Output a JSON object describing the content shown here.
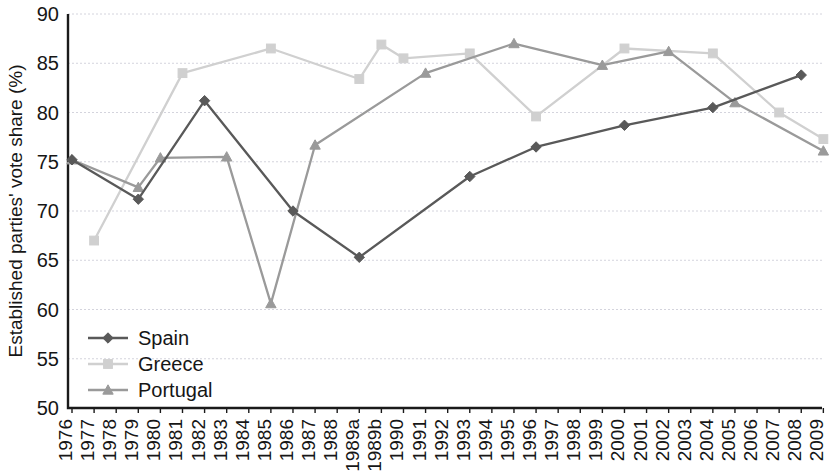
{
  "chart_data": {
    "type": "line",
    "title": "",
    "xlabel": "",
    "ylabel": "Established parties' vote share (%)",
    "ylim": [
      50,
      90
    ],
    "yticks": [
      50,
      55,
      60,
      65,
      70,
      75,
      80,
      85,
      90
    ],
    "ytick_labels": [
      "50",
      "55",
      "60",
      "65",
      "70",
      "75",
      "80",
      "85",
      "90"
    ],
    "grid": true,
    "legend_position": "lower-left-inside",
    "categories": [
      "1976",
      "1977",
      "1978",
      "1979",
      "1980",
      "1981",
      "1982",
      "1983",
      "1984",
      "1985",
      "1986",
      "1987",
      "1988",
      "1989a",
      "1989b",
      "1990",
      "1991",
      "1992",
      "1993",
      "1994",
      "1995",
      "1996",
      "1997",
      "1998",
      "1999",
      "2000",
      "2001",
      "2002",
      "2003",
      "2004",
      "2005",
      "2006",
      "2007",
      "2008",
      "2009"
    ],
    "series": [
      {
        "name": "Spain",
        "color": "#595959",
        "marker": "diamond",
        "x": [
          "1976",
          "1979",
          "1982",
          "1986",
          "1989a",
          "1993",
          "1996",
          "2000",
          "2004",
          "2008"
        ],
        "values": [
          75.2,
          71.2,
          81.2,
          70.0,
          65.3,
          73.5,
          76.5,
          78.7,
          80.5,
          83.8
        ]
      },
      {
        "name": "Greece",
        "color": "#d0d0d0",
        "marker": "square",
        "x": [
          "1977",
          "1981",
          "1985",
          "1989a",
          "1989b",
          "1990",
          "1993",
          "1996",
          "2000",
          "2004",
          "2007",
          "2009"
        ],
        "values": [
          67.0,
          84.0,
          86.5,
          83.4,
          86.9,
          85.5,
          86.0,
          79.6,
          86.5,
          86.0,
          80.0,
          77.3
        ]
      },
      {
        "name": "Portugal",
        "color": "#9a9a9a",
        "marker": "triangle",
        "x": [
          "1976",
          "1979",
          "1980",
          "1983",
          "1985",
          "1987",
          "1991",
          "1995",
          "1999",
          "2002",
          "2005",
          "2009"
        ],
        "values": [
          75.2,
          72.4,
          75.4,
          75.5,
          60.6,
          76.7,
          84.0,
          87.0,
          84.8,
          86.2,
          81.0,
          76.1
        ]
      }
    ]
  },
  "legend": {
    "entries": [
      {
        "label": "Spain"
      },
      {
        "label": "Greece"
      },
      {
        "label": "Portugal"
      }
    ]
  }
}
